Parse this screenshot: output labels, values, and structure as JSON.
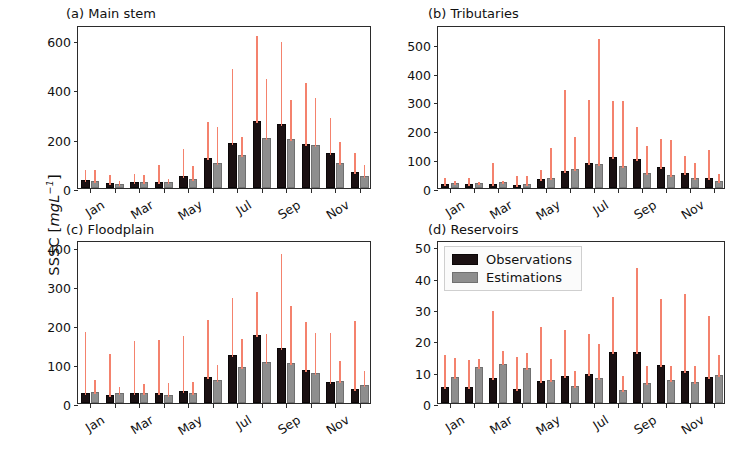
{
  "figure": {
    "ylabel_prefix": "SSSC [",
    "ylabel_unit": "mgL",
    "ylabel_exp": "−1",
    "ylabel_suffix": "]"
  },
  "legend": {
    "items": [
      {
        "key": "observations",
        "label": "Observations",
        "color": "#1a1012"
      },
      {
        "key": "estimations",
        "label": "Estimations",
        "color": "#8e8e8e"
      }
    ]
  },
  "colors": {
    "observations": "#1a1012",
    "estimations": "#8e8e8e",
    "errorbar": "#f4826d",
    "axis": "#2b2b2b"
  },
  "chart_data": [
    {
      "id": "a",
      "type": "bar",
      "title": "(a) Main stem",
      "xlabel": "",
      "ylabel": "SSSC [mgL-1]",
      "ylim": [
        0,
        660
      ],
      "yticks": [
        0,
        200,
        400,
        600
      ],
      "ytick_labels": [
        "0",
        "200",
        "400",
        "600"
      ],
      "grid": false,
      "legend_position": "none",
      "categories": [
        "Jan",
        "Feb",
        "Mar",
        "Apr",
        "May",
        "Jun",
        "Jul",
        "Aug",
        "Sep",
        "Oct",
        "Nov",
        "Dec"
      ],
      "xtick_labels": [
        "Jan",
        "",
        "Mar",
        "",
        "May",
        "",
        "Jul",
        "",
        "Sep",
        "",
        "Nov",
        ""
      ],
      "series": [
        {
          "name": "Observations",
          "values": [
            33,
            22,
            26,
            23,
            47,
            120,
            183,
            272,
            258,
            178,
            142,
            63
          ],
          "err_high": [
            83,
            60,
            65,
            103,
            166,
            274,
            488,
            625,
            600,
            432,
            291,
            150
          ]
        },
        {
          "name": "Estimations",
          "values": [
            27,
            18,
            25,
            23,
            37,
            103,
            133,
            204,
            200,
            176,
            103,
            50
          ],
          "err_high": [
            80,
            36,
            62,
            45,
            97,
            257,
            216,
            451,
            364,
            372,
            196,
            103
          ]
        }
      ]
    },
    {
      "id": "b",
      "type": "bar",
      "title": "(b) Tributaries",
      "xlabel": "",
      "ylabel": "SSSC [mgL-1]",
      "ylim": [
        0,
        565
      ],
      "yticks": [
        0,
        100,
        200,
        300,
        400,
        500
      ],
      "ytick_labels": [
        "0",
        "100",
        "200",
        "300",
        "400",
        "500"
      ],
      "grid": false,
      "legend_position": "none",
      "categories": [
        "Jan",
        "Feb",
        "Mar",
        "Apr",
        "May",
        "Jun",
        "Jul",
        "Aug",
        "Sep",
        "Oct",
        "Nov",
        "Dec"
      ],
      "xtick_labels": [
        "Jan",
        "",
        "Mar",
        "",
        "May",
        "",
        "Jul",
        "",
        "Sep",
        "",
        "Nov",
        ""
      ],
      "series": [
        {
          "name": "Observations",
          "values": [
            13,
            14,
            13,
            11,
            31,
            59,
            88,
            106,
            99,
            72,
            52,
            34
          ],
          "err_high": [
            40,
            40,
            92,
            47,
            70,
            347,
            313,
            310,
            219,
            177,
            118,
            140
          ]
        },
        {
          "name": "Estimations",
          "values": [
            16,
            19,
            20,
            15,
            34,
            66,
            84,
            77,
            53,
            46,
            34,
            25
          ],
          "err_high": [
            30,
            28,
            31,
            48,
            147,
            185,
            525,
            307,
            152,
            172,
            93,
            57
          ]
        }
      ]
    },
    {
      "id": "c",
      "type": "bar",
      "title": "(c) Floodplain",
      "xlabel": "",
      "ylabel": "SSSC [mgL-1]",
      "ylim": [
        0,
        418
      ],
      "yticks": [
        0,
        100,
        200,
        300,
        400
      ],
      "ytick_labels": [
        "0",
        "100",
        "200",
        "300",
        "400"
      ],
      "grid": false,
      "legend_position": "none",
      "categories": [
        "Jan",
        "Feb",
        "Mar",
        "Apr",
        "May",
        "Jun",
        "Jul",
        "Aug",
        "Sep",
        "Oct",
        "Nov",
        "Dec"
      ],
      "xtick_labels": [
        "Jan",
        "",
        "Mar",
        "",
        "May",
        "",
        "Jul",
        "",
        "Sep",
        "",
        "Nov",
        ""
      ],
      "series": [
        {
          "name": "Observations",
          "values": [
            25,
            21,
            25,
            25,
            30,
            66,
            122,
            174,
            140,
            85,
            55,
            37
          ],
          "err_high": [
            186,
            132,
            165,
            167,
            178,
            219,
            274,
            291,
            387,
            214,
            184,
            216
          ]
        },
        {
          "name": "Estimations",
          "values": [
            29,
            25,
            25,
            21,
            25,
            58,
            92,
            106,
            103,
            77,
            57,
            45
          ],
          "err_high": [
            63,
            47,
            54,
            57,
            58,
            102,
            170,
            182,
            253,
            185,
            112,
            87
          ]
        }
      ]
    },
    {
      "id": "d",
      "type": "bar",
      "title": "(d) Reservoirs",
      "xlabel": "",
      "ylabel": "SSSC [mgL-1]",
      "ylim": [
        0,
        52
      ],
      "yticks": [
        0,
        10,
        20,
        30,
        40,
        50
      ],
      "ytick_labels": [
        "0",
        "10",
        "20",
        "30",
        "40",
        "50"
      ],
      "grid": false,
      "legend_position": "upper left",
      "categories": [
        "Jan",
        "Feb",
        "Mar",
        "Apr",
        "May",
        "Jun",
        "Jul",
        "Aug",
        "Sep",
        "Oct",
        "Nov",
        "Dec"
      ],
      "xtick_labels": [
        "Jan",
        "",
        "Mar",
        "",
        "May",
        "",
        "Jul",
        "",
        "Sep",
        "",
        "Nov",
        ""
      ],
      "series": [
        {
          "name": "Observations",
          "values": [
            5.1,
            5.1,
            8.1,
            4.6,
            7.1,
            8.7,
            9.1,
            16.2,
            16.2,
            12.2,
            10.3,
            8.3
          ],
          "err_high": [
            15.8,
            14.4,
            29.9,
            15.2,
            24.9,
            23.8,
            22.7,
            34.6,
            43.8,
            33.8,
            35.4,
            28.3
          ]
        },
        {
          "name": "Estimations",
          "values": [
            8.2,
            11.5,
            12.6,
            11.2,
            7.4,
            5.4,
            7.9,
            4.1,
            6.5,
            7.4,
            6.6,
            8.9
          ],
          "err_high": [
            15.1,
            14.8,
            17.1,
            16.5,
            14.8,
            10.7,
            19.6,
            9.2,
            12.4,
            12.5,
            12.3,
            15.8
          ]
        }
      ]
    }
  ]
}
